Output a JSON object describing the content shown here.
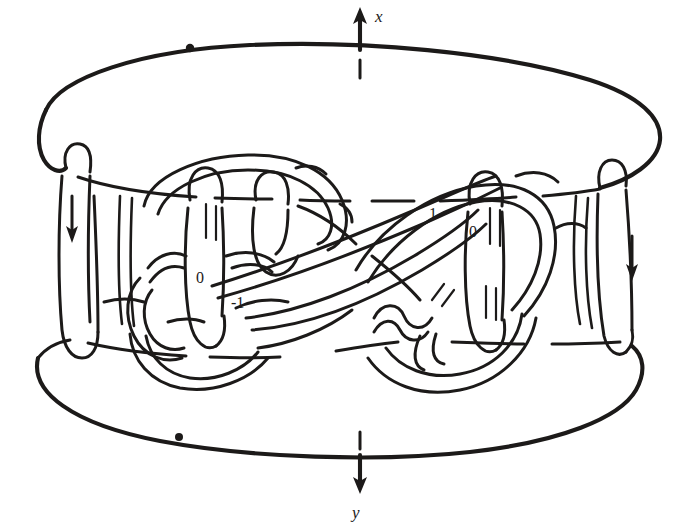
{
  "figure": {
    "kind": "knot-surgery-diagram",
    "background_color": "#ffffff",
    "ink_color": "#1c1a19"
  },
  "axes": {
    "top": {
      "label": "x",
      "direction": "up",
      "arrow_glyph": "arrow-up",
      "tick_present": true
    },
    "bottom": {
      "label": "y",
      "direction": "down",
      "arrow_glyph": "arrow-down",
      "tick_present": true
    }
  },
  "markers": {
    "basepoints": [
      {
        "name": "top-basepoint",
        "x": 190,
        "y": 48
      },
      {
        "name": "bottom-basepoint",
        "x": 179,
        "y": 437
      }
    ],
    "orientation_arrows": [
      {
        "name": "left-strand-orientation",
        "direction": "down",
        "x": 70,
        "y": 228
      },
      {
        "name": "right-strand-orientation",
        "direction": "down",
        "x": 632,
        "y": 268
      }
    ]
  },
  "coefficients": [
    {
      "id": "coef-left-zero",
      "value": "0",
      "x": 203,
      "y": 277
    },
    {
      "id": "coef-left-minus-one",
      "value": "-1",
      "x": 240,
      "y": 302
    },
    {
      "id": "coef-right-one",
      "value": "1",
      "x": 433,
      "y": 213
    },
    {
      "id": "coef-right-zero",
      "value": "0",
      "x": 475,
      "y": 231
    }
  ],
  "shell": {
    "top_ellipse_label": "upper boundary circle",
    "bottom_ellipse_label": "lower boundary circle",
    "left_wall_label": "left side wall",
    "right_wall_label": "right side wall"
  },
  "components": [
    {
      "id": "outer-shell",
      "label": "solid torus boundary"
    },
    {
      "id": "left-clasp",
      "label": "left clasped loop"
    },
    {
      "id": "right-clasp",
      "label": "right clasped loop"
    },
    {
      "id": "diagonal-band",
      "label": "central diagonal band"
    }
  ]
}
